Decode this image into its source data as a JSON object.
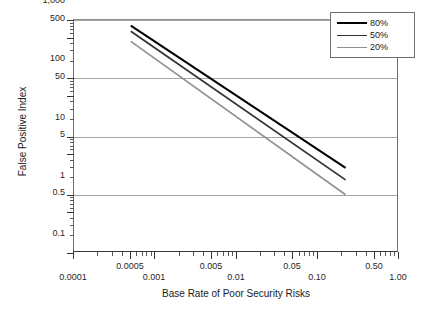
{
  "chart_data": {
    "type": "line",
    "title": "",
    "xlabel": "Base Rate of Poor Security Risks",
    "ylabel": "False Positive Index",
    "xscale": "log",
    "yscale": "log",
    "xlim": [
      0.0001,
      1.0
    ],
    "ylim": [
      0.1,
      1000
    ],
    "grid": true,
    "grid_values": [
      1000,
      100,
      10,
      1
    ],
    "legend_position": "top-right",
    "xticks": [
      0.0001,
      0.0005,
      0.001,
      0.005,
      0.01,
      0.05,
      0.1,
      0.5,
      1.0
    ],
    "xtick_labels": [
      "0.0001",
      "0.0005",
      "0.001",
      "0.005",
      "0.01",
      "0.05",
      "0.10",
      "0.50",
      "1.00"
    ],
    "xtick_rows": [
      1,
      0,
      1,
      0,
      1,
      0,
      1,
      0,
      1
    ],
    "yticks": [
      1000,
      500,
      100,
      50,
      10,
      5,
      1,
      0.5,
      0.1
    ],
    "ytick_labels": [
      "1,000",
      "500",
      "100",
      "50",
      "10",
      "5",
      "1",
      "0.5",
      "0.1"
    ],
    "series": [
      {
        "name": "80%",
        "color": "#000000",
        "width": 2.0,
        "x": [
          0.0005,
          0.22
        ],
        "y": [
          800,
          2.9
        ]
      },
      {
        "name": "50%",
        "color": "#333333",
        "width": 1.8,
        "x": [
          0.0005,
          0.22
        ],
        "y": [
          640,
          1.8
        ]
      },
      {
        "name": "20%",
        "color": "#909090",
        "width": 1.6,
        "x": [
          0.0005,
          0.22
        ],
        "y": [
          430,
          1.0
        ]
      }
    ]
  },
  "legend": {
    "items": [
      {
        "label": "80%",
        "color": "#000000",
        "width": 2.0
      },
      {
        "label": "50%",
        "color": "#333333",
        "width": 1.8
      },
      {
        "label": "20%",
        "color": "#909090",
        "width": 1.6
      }
    ]
  },
  "axes": {
    "x_title": "Base Rate of Poor Security Risks",
    "y_title": "False Positive Index"
  }
}
